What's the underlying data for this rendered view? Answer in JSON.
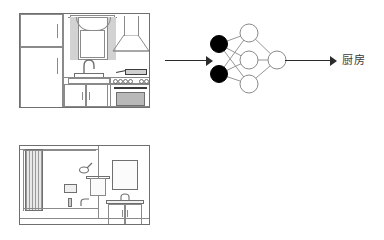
{
  "figure": {
    "type": "diagram",
    "background_color": "#ffffff",
    "line_color": "#8a8a8a",
    "arrow_color": "#2b2b2b",
    "input_node_color": "#000000",
    "hidden_node_color": "#ffffff"
  },
  "rows": [
    {
      "id": "kitchen",
      "scene_name": "kitchen-line-drawing",
      "scene_elements": [
        "refrigerator",
        "window-with-curtains",
        "sink-with-faucet",
        "base-cabinets",
        "range-hood",
        "cooktop-with-knobs",
        "oven"
      ],
      "input_arrow": "arrow-right",
      "network": {
        "name": "neural-network",
        "layers": [
          2,
          3,
          1
        ],
        "input_nodes": 2,
        "hidden_nodes": 3,
        "output_nodes": 1,
        "input_fill": "black",
        "other_fill": "white"
      },
      "output_arrow": "arrow-right",
      "output_label": "厨房"
    },
    {
      "id": "bathroom",
      "scene_name": "bathroom-line-drawing",
      "scene_elements": [
        "shower-curtain",
        "bathtub",
        "shower-head",
        "wall-picture",
        "bottle",
        "tub-faucet",
        "towel-bar-with-towel",
        "mirror",
        "vanity-sink",
        "vanity-cabinet"
      ],
      "input_arrow": "arrow-right",
      "network": {
        "name": "neural-network",
        "layers": [
          2,
          3,
          1
        ],
        "input_nodes": 2,
        "hidden_nodes": 3,
        "output_nodes": 1,
        "input_fill": "black",
        "other_fill": "white"
      },
      "output_arrow": "arrow-right",
      "output_label": "浴室"
    }
  ]
}
